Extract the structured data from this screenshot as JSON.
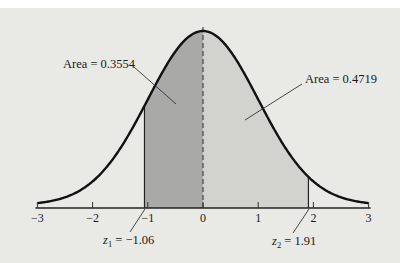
{
  "chart_data": {
    "type": "area",
    "title": "",
    "xlabel": "",
    "ylabel": "",
    "xlim": [
      -3,
      3
    ],
    "x_ticks": [
      -3,
      -2,
      -1,
      0,
      1,
      2,
      3
    ],
    "x_tick_labels": [
      "−3",
      "−2",
      "−1",
      "0",
      "1",
      "2",
      "3"
    ],
    "grid": false,
    "legend": null,
    "curve": "standard normal density",
    "shaded_regions": [
      {
        "from": -1.06,
        "to": 0,
        "area": 0.3554,
        "label": "Area = 0.3554",
        "color": "#a9a9a7"
      },
      {
        "from": 0,
        "to": 1.91,
        "area": 0.4719,
        "label": "Area = 0.4719",
        "color": "#d2d2cf"
      }
    ],
    "annotations": [
      {
        "text": "Area = 0.3554",
        "points_to": "left shaded region"
      },
      {
        "text": "Area = 0.4719",
        "points_to": "right shaded region"
      },
      {
        "text": "z₁ = −1.06",
        "points_to": "z = -1.06 on axis"
      },
      {
        "text": "z₂ = 1.91",
        "points_to": "z = 1.91 on axis"
      }
    ],
    "mean_line": {
      "x": 0,
      "style": "dashed"
    }
  },
  "labels": {
    "area_left": "Area = 0.3554",
    "area_right": "Area = 0.4719",
    "z1_sym": "z",
    "z1_sub": "1",
    "z1_val": " = −1.06",
    "z2_sym": "z",
    "z2_sub": "2",
    "z2_val": " = 1.91"
  },
  "colors": {
    "background": "#e9e9e6",
    "curve": "#111111",
    "shade_left": "#a9a9a7",
    "shade_right": "#d2d2cf"
  }
}
